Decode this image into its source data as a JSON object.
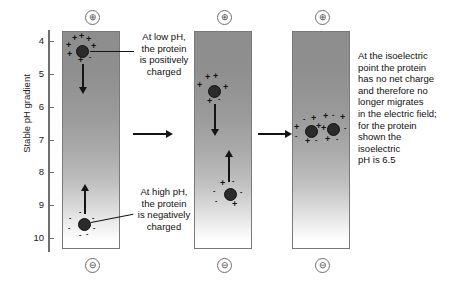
{
  "figure": {
    "axis": {
      "title": "Stable pH gradient",
      "ticks": [
        "4",
        "5",
        "6",
        "7",
        "8",
        "9",
        "10"
      ]
    },
    "electrodes": {
      "positive_symbol": "⊕",
      "negative_symbol": "⊖",
      "positive_name": "anode",
      "negative_name": "cathode"
    },
    "columns": [
      {
        "id": "column-1",
        "label": "initial state",
        "proteins": [
          {
            "id": "protein-top",
            "ph": 4.3,
            "net_charge": "positive",
            "charge_symbols": [
              "+",
              "+",
              "+",
              "+",
              "+",
              "+",
              "-",
              "-"
            ],
            "migration": "down"
          },
          {
            "id": "protein-bottom",
            "ph": 9.8,
            "net_charge": "negative",
            "charge_symbols": [
              "-",
              "-",
              "-",
              "-",
              "-",
              "-",
              "+"
            ],
            "migration": "up"
          }
        ]
      },
      {
        "id": "column-2",
        "label": "migrating state",
        "proteins": [
          {
            "id": "protein-top",
            "ph": 5.5,
            "net_charge": "positive",
            "charge_symbols": [
              "+",
              "+",
              "+",
              "+",
              "+",
              "-"
            ],
            "migration": "down"
          },
          {
            "id": "protein-bottom",
            "ph": 8.8,
            "net_charge": "negative",
            "charge_symbols": [
              "-",
              "-",
              "-",
              "-",
              "+",
              "+"
            ],
            "migration": "up"
          }
        ]
      },
      {
        "id": "column-3",
        "label": "isoelectric focus",
        "proteins": [
          {
            "id": "protein-left",
            "ph": 6.5,
            "net_charge": "neutral",
            "charge_symbols": [
              "-",
              "+",
              "+",
              "-",
              "+",
              "-",
              "+"
            ],
            "migration": "none"
          },
          {
            "id": "protein-right",
            "ph": 6.5,
            "net_charge": "neutral",
            "charge_symbols": [
              "+",
              "-",
              "+",
              "-",
              "+",
              "-",
              "+"
            ],
            "migration": "none"
          }
        ]
      }
    ],
    "annotations": {
      "low_ph": [
        "At low pH,",
        "the protein",
        "is positively",
        "charged"
      ],
      "high_ph": [
        "At high pH,",
        "the protein",
        "is negatively",
        "charged"
      ],
      "isoelectric": [
        "At the isoelectric",
        "point the protein",
        "has no net charge",
        "and therefore no",
        "longer migrates",
        "in the electric field;",
        "for the protein",
        "shown the",
        "isoelectric",
        "pH is 6.5"
      ]
    },
    "colors": {
      "gel_dark": "#8d8d8d",
      "gel_light": "#ffffff",
      "protein": "#2b2b2b",
      "arrow": "#141414",
      "axis": "#6e6e6e"
    }
  }
}
